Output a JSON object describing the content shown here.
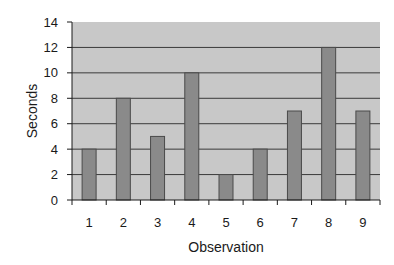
{
  "chart_data": {
    "type": "bar",
    "title": "",
    "xlabel": "Observation",
    "ylabel": "Seconds",
    "categories": [
      "1",
      "2",
      "3",
      "4",
      "5",
      "6",
      "7",
      "8",
      "9"
    ],
    "values": [
      4,
      8,
      5,
      10,
      2,
      4,
      7,
      12,
      7
    ],
    "ylim": [
      0,
      14
    ],
    "yticks": [
      0,
      2,
      4,
      6,
      8,
      10,
      12,
      14
    ],
    "grid": true,
    "legend": null,
    "colors": {
      "plot_background": "#c8c8c8",
      "bar_fill": "#8a8a8a",
      "bar_stroke": "#4a4a4a",
      "gridline": "#3a3a3a"
    }
  }
}
